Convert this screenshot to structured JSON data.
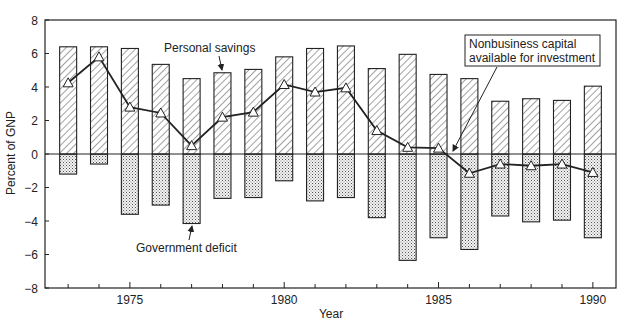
{
  "chart_data": {
    "type": "bar",
    "title": "",
    "xlabel": "Year",
    "ylabel": "Percent of GNP",
    "ylim": [
      -8,
      8
    ],
    "xlim": [
      1972.25,
      1990.75
    ],
    "yticks": [
      8,
      6,
      4,
      2,
      0,
      -2,
      -4,
      -6,
      -8
    ],
    "ytick_labels": [
      "8",
      "6",
      "4",
      "2",
      "0",
      "−2",
      "−4",
      "−6",
      "−8"
    ],
    "xtick_major": [
      1975,
      1980,
      1985,
      1990
    ],
    "xtick_labels": [
      "1975",
      "1980",
      "1985",
      "1990"
    ],
    "x": [
      1973,
      1974,
      1975,
      1976,
      1977,
      1978,
      1979,
      1980,
      1981,
      1982,
      1983,
      1984,
      1985,
      1986,
      1987,
      1988,
      1989,
      1990
    ],
    "series": [
      {
        "name": "Personal savings",
        "kind": "bar",
        "pattern": "diagonal-hatch",
        "values": [
          6.4,
          6.4,
          6.3,
          5.35,
          4.5,
          4.85,
          5.05,
          5.8,
          6.3,
          6.45,
          5.1,
          5.95,
          4.75,
          4.5,
          3.15,
          3.3,
          3.2,
          4.05
        ]
      },
      {
        "name": "Government deficit",
        "kind": "bar",
        "pattern": "dotted",
        "values": [
          -1.2,
          -0.6,
          -3.6,
          -3.05,
          -4.15,
          -2.65,
          -2.6,
          -1.6,
          -2.8,
          -2.6,
          -3.8,
          -6.35,
          -5.0,
          -5.7,
          -3.7,
          -4.05,
          -3.95,
          -5.0
        ]
      },
      {
        "name": "Nonbusiness capital available for investment",
        "kind": "line",
        "marker": "triangle",
        "values": [
          4.25,
          5.8,
          2.8,
          2.45,
          0.5,
          2.2,
          2.5,
          4.15,
          3.7,
          3.95,
          1.4,
          0.4,
          0.35,
          -1.15,
          -0.6,
          -0.7,
          -0.6,
          -1.1
        ]
      }
    ],
    "annotations": [
      {
        "text": "Personal savings",
        "points_to": "Personal savings bar 1978"
      },
      {
        "text": "Government deficit",
        "points_to": "Government deficit bar 1977"
      },
      {
        "text_lines": [
          "Nonbusiness capital",
          "available for investment"
        ],
        "boxed": true,
        "points_to": "line near 1985.5"
      }
    ],
    "grid": false,
    "zero_line": true,
    "legend": "none (inline annotations)"
  }
}
